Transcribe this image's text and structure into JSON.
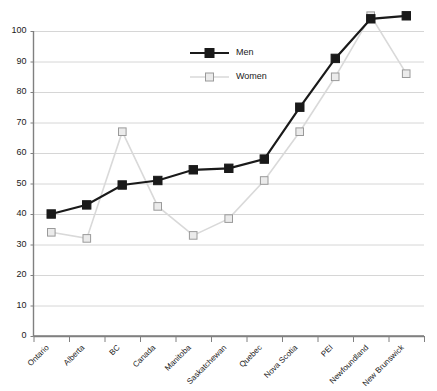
{
  "chart_data": {
    "type": "line",
    "title": "",
    "xlabel": "",
    "ylabel": "",
    "ylim": [
      0,
      100
    ],
    "yticks": [
      0,
      10,
      20,
      30,
      40,
      50,
      60,
      70,
      80,
      90,
      100
    ],
    "grid": true,
    "legend_position": "top-center",
    "categories": [
      "Ontario",
      "Alberta",
      "BC",
      "Canada",
      "Manitoba",
      "Saskatchewan",
      "Quebec",
      "Nova Scotia",
      "PEI",
      "Newfoundland",
      "New Brunswick"
    ],
    "series": [
      {
        "name": "Men",
        "color": "#1a1a1a",
        "marker": "filled-square",
        "values": [
          40,
          43,
          49.5,
          51,
          54.5,
          55,
          58,
          75,
          91,
          104,
          105
        ]
      },
      {
        "name": "Women",
        "color": "#d9d9d9",
        "marker": "open-square",
        "values": [
          34,
          32,
          67,
          42.5,
          33,
          38.5,
          51,
          67,
          85,
          105,
          86
        ]
      }
    ]
  },
  "legend": {
    "items": [
      {
        "label": "Men"
      },
      {
        "label": "Women"
      }
    ]
  },
  "axes": {
    "y_tick_labels": [
      "0",
      "10",
      "20",
      "30",
      "40",
      "50",
      "60",
      "70",
      "80",
      "90",
      "100"
    ],
    "x_tick_labels": [
      "Ontario",
      "Alberta",
      "BC",
      "Canada",
      "Manitoba",
      "Saskatchewan",
      "Quebec",
      "Nova Scotia",
      "PEI",
      "Newfoundland",
      "New Brunswick"
    ]
  },
  "colors": {
    "men_line": "#1a1a1a",
    "women_line": "#d9d9d9",
    "grid": "#d6d6d6",
    "axis": "#808080",
    "background": "#ffffff"
  }
}
